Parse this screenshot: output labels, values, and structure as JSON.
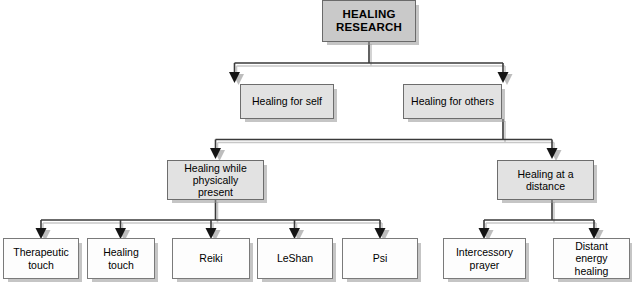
{
  "diagram": {
    "colors": {
      "root_fill": "#c9c9c9",
      "mid_fill": "#e2e2e2",
      "leaf_fill": "#fdfdfd",
      "border": "#6d6d6d",
      "connector": "#3a3a3a",
      "connector_shadow": "#c4c4c4",
      "arrow": "#141414",
      "arrow_shadow": "#bdbdbd",
      "page_background": "#ffffff"
    },
    "nodes": {
      "root": {
        "label": "HEALING RESEARCH",
        "line1": "HEALING",
        "line2": "RESEARCH"
      },
      "level2": [
        {
          "id": "healing-for-self",
          "label": "Healing for self"
        },
        {
          "id": "healing-for-others",
          "label": "Healing for others"
        }
      ],
      "level3": [
        {
          "id": "healing-while-physically-present",
          "label": "Healing while physically present",
          "line1": "Healing while",
          "line2": "physically present"
        },
        {
          "id": "healing-at-a-distance",
          "label": "Healing at a distance",
          "line1": "Healing at a",
          "line2": "distance"
        }
      ],
      "leaves_present": [
        {
          "id": "therapeutic-touch",
          "label": "Therapeutic touch",
          "line1": "Therapeutic",
          "line2": "touch"
        },
        {
          "id": "healing-touch",
          "label": "Healing touch",
          "line1": "Healing",
          "line2": "touch"
        },
        {
          "id": "reiki",
          "label": "Reiki",
          "line1": "Reiki",
          "line2": ""
        },
        {
          "id": "leshan",
          "label": "LeShan",
          "line1": "LeShan",
          "line2": ""
        },
        {
          "id": "psi",
          "label": "Psi",
          "line1": "Psi",
          "line2": ""
        }
      ],
      "leaves_distance": [
        {
          "id": "intercessory-prayer",
          "label": "Intercessory prayer",
          "line1": "Intercessory",
          "line2": "prayer"
        },
        {
          "id": "distant-energy-healing",
          "label": "Distant energy healing",
          "line1": "Distant",
          "line2": "energy healing"
        }
      ]
    },
    "edges": [
      {
        "from": "HEALING RESEARCH",
        "to": "Healing for self"
      },
      {
        "from": "HEALING RESEARCH",
        "to": "Healing for others"
      },
      {
        "from": "Healing for others",
        "to": "Healing while physically present"
      },
      {
        "from": "Healing for others",
        "to": "Healing at a distance"
      },
      {
        "from": "Healing while physically present",
        "to": "Therapeutic touch"
      },
      {
        "from": "Healing while physically present",
        "to": "Healing touch"
      },
      {
        "from": "Healing while physically present",
        "to": "Reiki"
      },
      {
        "from": "Healing while physically present",
        "to": "LeShan"
      },
      {
        "from": "Healing while physically present",
        "to": "Psi"
      },
      {
        "from": "Healing at a distance",
        "to": "Intercessory prayer"
      },
      {
        "from": "Healing at a distance",
        "to": "Distant energy healing"
      }
    ]
  }
}
